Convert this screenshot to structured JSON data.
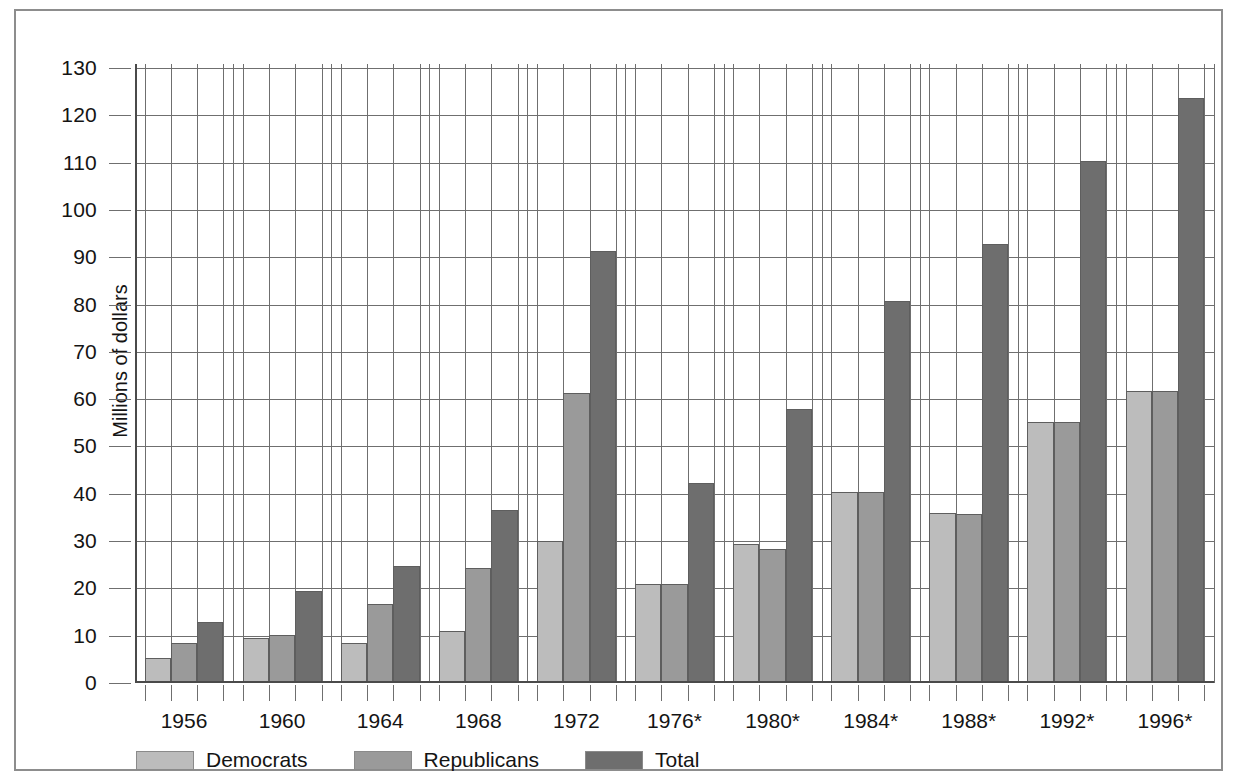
{
  "chart_data": {
    "type": "bar",
    "title": "",
    "xlabel": "",
    "ylabel": "Millions of dollars",
    "ylim": [
      0,
      130
    ],
    "ytick_step": 10,
    "yticks": [
      0,
      10,
      20,
      30,
      40,
      50,
      60,
      70,
      80,
      90,
      100,
      110,
      120,
      130
    ],
    "grid": true,
    "legend_position": "bottom-left",
    "categories": [
      "1956",
      "1960",
      "1964",
      "1968",
      "1972",
      "1976*",
      "1980*",
      "1984*",
      "1988*",
      "1992*",
      "1996*"
    ],
    "series": [
      {
        "name": "Democrats",
        "color": "#bcbcbc",
        "values": [
          5.3,
          9.6,
          8.5,
          11.1,
          30.0,
          21.0,
          29.4,
          40.4,
          36.0,
          55.2,
          61.8
        ]
      },
      {
        "name": "Republicans",
        "color": "#9a9a9a",
        "values": [
          8.4,
          10.1,
          16.7,
          24.3,
          61.4,
          21.0,
          28.4,
          40.4,
          35.7,
          55.2,
          61.8
        ]
      },
      {
        "name": "Total",
        "color": "#6e6e6e",
        "values": [
          12.9,
          19.4,
          24.8,
          36.5,
          91.4,
          42.3,
          57.9,
          80.8,
          92.7,
          110.4,
          123.6
        ]
      }
    ]
  },
  "legend": {
    "items": [
      {
        "label": "Democrats",
        "key": "dem"
      },
      {
        "label": "Republicans",
        "key": "rep"
      },
      {
        "label": "Total",
        "key": "tot"
      }
    ]
  },
  "axis": {
    "y_title": "Millions of dollars"
  }
}
